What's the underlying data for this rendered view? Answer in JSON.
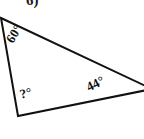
{
  "figure": {
    "problem_number": "6)",
    "shape": "triangle",
    "stroke_color": "#111111",
    "fill_color": "#ffffff",
    "background_color": "#ffffff",
    "stroke_width": 2,
    "vertices": [
      {
        "name": "top-left",
        "x": 1,
        "y": 18
      },
      {
        "name": "right",
        "x": 152,
        "y": 89
      },
      {
        "name": "bottom-left",
        "x": 18,
        "y": 116
      }
    ],
    "angles": [
      {
        "id": "angle-top-left",
        "label": "60°",
        "value": 60,
        "known": true,
        "rotation": -58
      },
      {
        "id": "angle-bottom-left",
        "label": "?°",
        "value": null,
        "known": false,
        "rotation": -14
      },
      {
        "id": "angle-right",
        "label": "44°",
        "value": 44,
        "known": true,
        "rotation": -26
      }
    ]
  }
}
